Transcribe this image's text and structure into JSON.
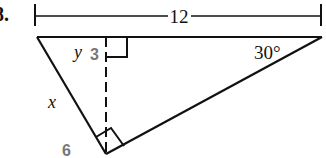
{
  "problem_number": "8.",
  "labels": {
    "top_length": "12",
    "angle": "30°",
    "segment_y": "y",
    "segment_y_value": "3",
    "side_x": "x",
    "side_x_value": "6"
  },
  "colors": {
    "line": "#111111",
    "answer": "#777777"
  }
}
